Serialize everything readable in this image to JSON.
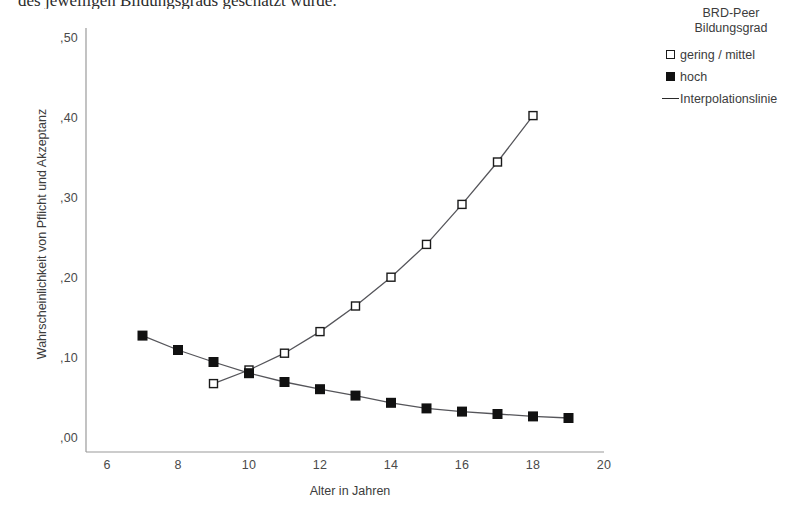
{
  "page": {
    "cutoff_text": "des jeweiligen Bildungsgrads geschätzt wurde."
  },
  "legend": {
    "title_line1": "BRD-Peer",
    "title_line2": "Bildungsgrad",
    "items": [
      {
        "label": "gering / mittel",
        "key": "open-square-marker"
      },
      {
        "label": "hoch",
        "key": "filled-square-marker"
      },
      {
        "label": "Interpolationslinie",
        "key": "line-marker"
      }
    ]
  },
  "axes": {
    "y_title": "Wahrscheinlichkeit von Pflicht und Akzeptanz",
    "x_title": "Alter in Jahren",
    "y_ticks": [
      ",50",
      ",40",
      ",30",
      ",20",
      ",10",
      ",00"
    ],
    "x_ticks": [
      "6",
      "8",
      "10",
      "12",
      "14",
      "16",
      "18",
      "20"
    ]
  },
  "colors": {
    "marker_fill": "#111111",
    "marker_stroke": "#1a1a1a",
    "line": "#55555a",
    "axis": "#9a9a9a",
    "text": "#3c3c3c",
    "background": "#ffffff"
  },
  "chart_data": {
    "type": "line",
    "title": "",
    "subtitle": "",
    "xlabel": "Alter in Jahren",
    "ylabel": "Wahrscheinlichkeit von Pflicht und Akzeptanz",
    "xlim": [
      5,
      21
    ],
    "ylim": [
      0.0,
      0.53
    ],
    "xticks": [
      6,
      8,
      10,
      12,
      14,
      16,
      18,
      20
    ],
    "yticks": [
      0.0,
      0.1,
      0.2,
      0.3,
      0.4,
      0.5
    ],
    "ytick_labels": [
      ",00",
      ",10",
      ",20",
      ",30",
      ",40",
      ",50"
    ],
    "grid": false,
    "legend_position": "right",
    "series": [
      {
        "name": "gering / mittel",
        "marker": "open-square",
        "x": [
          9,
          10,
          11,
          12,
          13,
          14,
          15,
          16,
          17,
          18
        ],
        "values": [
          0.068,
          0.085,
          0.106,
          0.133,
          0.165,
          0.201,
          0.242,
          0.292,
          0.345,
          0.403
        ]
      },
      {
        "name": "hoch",
        "marker": "filled-square",
        "x": [
          7,
          8,
          9,
          10,
          11,
          12,
          13,
          14,
          15,
          16,
          17,
          18,
          19
        ],
        "values": [
          0.128,
          0.11,
          0.095,
          0.081,
          0.07,
          0.061,
          0.053,
          0.044,
          0.037,
          0.033,
          0.03,
          0.027,
          0.025
        ]
      }
    ]
  }
}
